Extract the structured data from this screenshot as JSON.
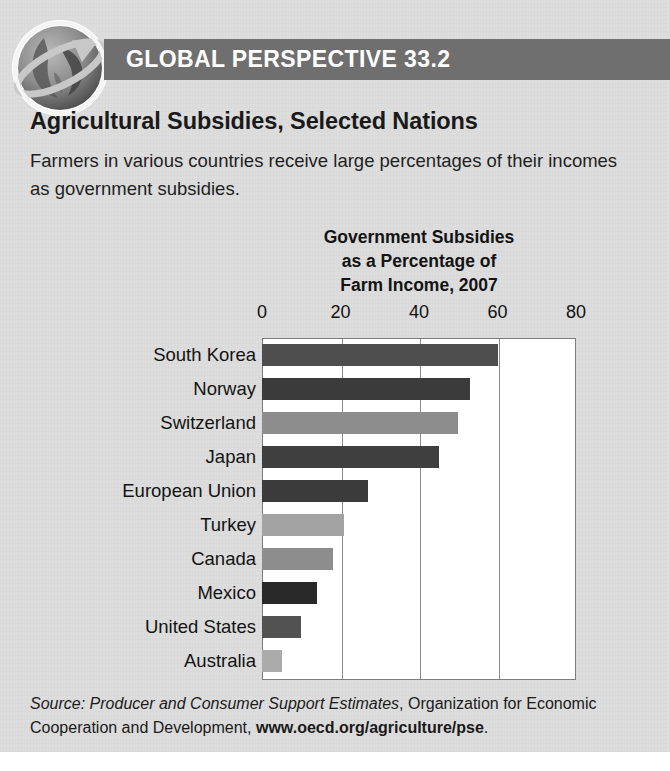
{
  "panel": {
    "header_title": "GLOBAL PERSPECTIVE 33.2",
    "globe_icon": "globe-arrow-icon",
    "section_title": "Agricultural Subsidies, Selected Nations",
    "section_description": "Farmers in various countries receive large percentages of their incomes as government subsidies.",
    "header_band_color": "#6f6f6f",
    "background_color": "#dddddd"
  },
  "source": {
    "prefix": "Source:",
    "italic_part": "Producer and Consumer Support Estimates",
    "middle_part": ", Organization for Economic Cooperation and Development,",
    "bold_url": "www.oecd.org/agriculture/pse",
    "suffix": "."
  },
  "chart_data": {
    "type": "bar",
    "orientation": "horizontal",
    "title_lines": [
      "Government Subsidies",
      "as a Percentage of",
      "Farm Income, 2007"
    ],
    "xlabel": "",
    "ylabel": "",
    "xlim": [
      0,
      80
    ],
    "ticks": [
      0,
      20,
      40,
      60,
      80
    ],
    "tick_labels": [
      "0",
      "20",
      "40",
      "60",
      "80"
    ],
    "grid": true,
    "legend": "none",
    "categories": [
      "South Korea",
      "Norway",
      "Switzerland",
      "Japan",
      "European Union",
      "Turkey",
      "Canada",
      "Mexico",
      "United States",
      "Australia"
    ],
    "values": [
      60,
      53,
      50,
      45,
      27,
      21,
      18,
      14,
      10,
      5
    ],
    "bar_colors": [
      "#4e4e4e",
      "#3b3b3b",
      "#8d8d8d",
      "#3f3f3f",
      "#3b3b3b",
      "#a3a3a3",
      "#8d8d8d",
      "#292929",
      "#525252",
      "#ababab"
    ]
  }
}
